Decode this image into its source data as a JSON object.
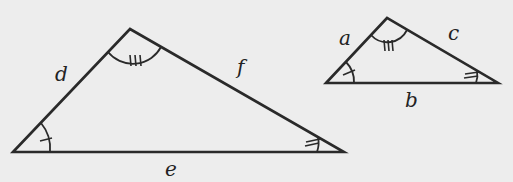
{
  "diagram": {
    "large_triangle": {
      "sides": {
        "left": "d",
        "right": "f",
        "bottom": "e"
      },
      "angle_marks": {
        "bottom_left": "single tick",
        "top": "triple tick",
        "bottom_right": "double tick"
      }
    },
    "small_triangle": {
      "sides": {
        "left": "a",
        "right": "c",
        "bottom": "b"
      },
      "angle_marks": {
        "bottom_left": "single tick",
        "top": "triple tick",
        "bottom_right": "double tick"
      }
    },
    "colors": {
      "background": "#ededed",
      "stroke": "#2a2a2a"
    }
  }
}
